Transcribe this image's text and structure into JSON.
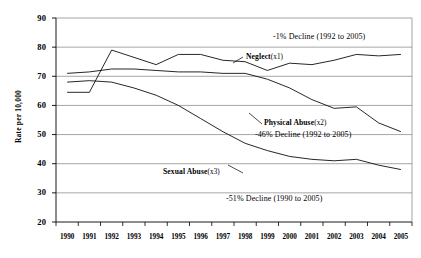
{
  "chart_data": {
    "type": "line",
    "title": "",
    "xlabel": "",
    "ylabel": "Rate per 10,000",
    "ylim": [
      20,
      90
    ],
    "yticks": [
      20,
      30,
      40,
      50,
      60,
      70,
      80,
      90
    ],
    "grid": true,
    "legend_position": "inline-annotations",
    "categories": [
      "1990",
      "1991",
      "1992",
      "1993",
      "1994",
      "1995",
      "1996",
      "1997",
      "1998",
      "1999",
      "2000",
      "2001",
      "2002",
      "2003",
      "2004",
      "2005"
    ],
    "series": [
      {
        "name": "Neglect (x1)",
        "label_text": "Neglect",
        "label_multiplier": "(x1)",
        "values": [
          64.5,
          64.5,
          79.0,
          76.5,
          74.0,
          77.5,
          77.5,
          75.5,
          75.0,
          72.0,
          74.5,
          74.0,
          75.5,
          77.5,
          77.0,
          77.5
        ]
      },
      {
        "name": "Physical Abuse (x2)",
        "label_text": "Physical Abuse",
        "label_multiplier": "(x2)",
        "values": [
          71.0,
          71.5,
          72.5,
          72.5,
          72.0,
          71.5,
          71.5,
          71.0,
          71.0,
          69.0,
          66.0,
          62.0,
          59.0,
          59.5,
          54.0,
          51.0
        ]
      },
      {
        "name": "Sexual Abuse (x3)",
        "label_text": "Sexual Abuse",
        "label_multiplier": "(x3)",
        "values": [
          68.0,
          68.5,
          68.0,
          66.0,
          63.5,
          60.0,
          55.5,
          51.0,
          47.0,
          44.5,
          42.5,
          41.5,
          41.0,
          41.5,
          39.5,
          38.0
        ]
      }
    ],
    "annotations": [
      {
        "id": "neglect-decline",
        "text": "-1% Decline (1992 to 2005)"
      },
      {
        "id": "physical-decline",
        "text": "-46% Decline (1992 to 2005)"
      },
      {
        "id": "sexual-decline",
        "text": "-51% Decline (1990 to 2005)"
      }
    ],
    "colors": {
      "line": "#000000",
      "grid": "#808080",
      "axis": "#000000",
      "background": "#ffffff"
    }
  }
}
